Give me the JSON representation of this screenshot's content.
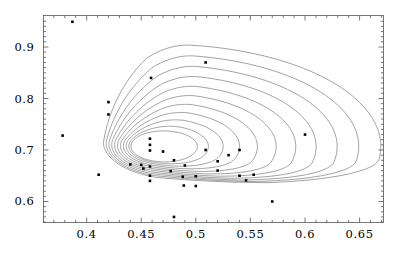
{
  "chart_data": {
    "type": "scatter",
    "title": "",
    "subtitle": "",
    "xlabel": "",
    "ylabel": "",
    "xlim": [
      0.3605,
      0.6719
    ],
    "ylim": [
      0.5592,
      0.9612
    ],
    "grid": false,
    "legend": null,
    "frame": true,
    "x_ticks": [
      0.4,
      0.45,
      0.5,
      0.55,
      0.6,
      0.65
    ],
    "x_tick_labels": [
      "0.4",
      "0.45",
      "0.5",
      "0.55",
      "0.6",
      "0.65"
    ],
    "y_ticks": [
      0.6,
      0.7,
      0.8,
      0.9
    ],
    "y_tick_labels": [
      "0.6",
      "0.7",
      "0.8",
      "0.9"
    ],
    "x_minor_ticks": [
      0.37,
      0.38,
      0.39,
      0.41,
      0.42,
      0.43,
      0.44,
      0.46,
      0.47,
      0.48,
      0.49,
      0.51,
      0.52,
      0.53,
      0.54,
      0.56,
      0.57,
      0.58,
      0.59,
      0.61,
      0.62,
      0.63,
      0.64,
      0.66,
      0.67
    ],
    "y_minor_ticks": [
      0.56,
      0.57,
      0.58,
      0.59,
      0.61,
      0.62,
      0.63,
      0.64,
      0.65,
      0.66,
      0.67,
      0.68,
      0.69,
      0.71,
      0.72,
      0.73,
      0.74,
      0.75,
      0.76,
      0.77,
      0.78,
      0.79,
      0.81,
      0.82,
      0.83,
      0.84,
      0.85,
      0.86,
      0.87,
      0.88,
      0.89,
      0.91,
      0.92,
      0.93,
      0.94,
      0.95
    ],
    "point_color": "#000000",
    "point_size": 2.6,
    "contour_color": "#555555",
    "points": [
      {
        "x": 0.387,
        "y": 0.949
      },
      {
        "x": 0.509,
        "y": 0.87
      },
      {
        "x": 0.459,
        "y": 0.84
      },
      {
        "x": 0.42,
        "y": 0.793
      },
      {
        "x": 0.42,
        "y": 0.769
      },
      {
        "x": 0.6,
        "y": 0.73
      },
      {
        "x": 0.378,
        "y": 0.728
      },
      {
        "x": 0.458,
        "y": 0.722
      },
      {
        "x": 0.458,
        "y": 0.71
      },
      {
        "x": 0.54,
        "y": 0.7
      },
      {
        "x": 0.509,
        "y": 0.7
      },
      {
        "x": 0.458,
        "y": 0.699
      },
      {
        "x": 0.47,
        "y": 0.697
      },
      {
        "x": 0.53,
        "y": 0.69
      },
      {
        "x": 0.48,
        "y": 0.68
      },
      {
        "x": 0.52,
        "y": 0.678
      },
      {
        "x": 0.44,
        "y": 0.672
      },
      {
        "x": 0.45,
        "y": 0.671
      },
      {
        "x": 0.49,
        "y": 0.67
      },
      {
        "x": 0.458,
        "y": 0.668
      },
      {
        "x": 0.452,
        "y": 0.664
      },
      {
        "x": 0.52,
        "y": 0.66
      },
      {
        "x": 0.477,
        "y": 0.659
      },
      {
        "x": 0.411,
        "y": 0.652
      },
      {
        "x": 0.553,
        "y": 0.652
      },
      {
        "x": 0.458,
        "y": 0.65
      },
      {
        "x": 0.54,
        "y": 0.65
      },
      {
        "x": 0.5,
        "y": 0.649
      },
      {
        "x": 0.488,
        "y": 0.648
      },
      {
        "x": 0.546,
        "y": 0.641
      },
      {
        "x": 0.458,
        "y": 0.64
      },
      {
        "x": 0.489,
        "y": 0.631
      },
      {
        "x": 0.5,
        "y": 0.63
      },
      {
        "x": 0.57,
        "y": 0.6
      },
      {
        "x": 0.48,
        "y": 0.57
      }
    ],
    "contours": {
      "count": 11,
      "description": "nested teardrop-shaped density contours elongated toward upper-right, tightly bunched along lower-left flank",
      "center": {
        "x": 0.471,
        "y": 0.707
      },
      "levels": [
        1,
        2,
        3,
        4,
        5,
        6,
        7,
        8,
        9,
        10,
        11
      ]
    }
  }
}
